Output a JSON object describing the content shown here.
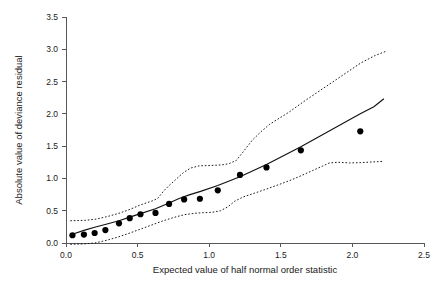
{
  "chart_data": {
    "type": "scatter",
    "title": "",
    "xlabel": "Expected value of half normal order statistic",
    "ylabel": "Absolute value of deviance residual",
    "xlim": [
      0.0,
      2.5
    ],
    "ylim": [
      0.0,
      3.5
    ],
    "xticks": [
      0.0,
      0.5,
      1.0,
      1.5,
      2.0,
      2.5
    ],
    "xticklabels": [
      "0.0",
      "0.5",
      "1.0",
      "1.5",
      "2.0",
      "2.5"
    ],
    "yticks": [
      0.0,
      0.5,
      1.0,
      1.5,
      2.0,
      2.5,
      3.0,
      3.5
    ],
    "yticklabels": [
      "0.0",
      "0.5",
      "1.0",
      "1.5",
      "2.0",
      "2.5",
      "3.0",
      "3.5"
    ],
    "grid": false,
    "legend": "none",
    "series": [
      {
        "name": "Absolute deviance residuals",
        "type": "scatter",
        "marker": "filled-circle",
        "color": "#000000",
        "points": [
          [
            0.045,
            0.12
          ],
          [
            0.125,
            0.13
          ],
          [
            0.2,
            0.155
          ],
          [
            0.275,
            0.2
          ],
          [
            0.37,
            0.305
          ],
          [
            0.445,
            0.385
          ],
          [
            0.52,
            0.445
          ],
          [
            0.625,
            0.465
          ],
          [
            0.72,
            0.605
          ],
          [
            0.825,
            0.675
          ],
          [
            0.935,
            0.685
          ],
          [
            1.06,
            0.815
          ],
          [
            1.215,
            1.055
          ],
          [
            1.4,
            1.17
          ],
          [
            1.64,
            1.435
          ],
          [
            2.055,
            1.73
          ]
        ]
      },
      {
        "name": "Simulated envelope mean",
        "type": "line",
        "style": "solid",
        "color": "#111111",
        "points": [
          [
            0.045,
            0.135
          ],
          [
            0.125,
            0.195
          ],
          [
            0.2,
            0.245
          ],
          [
            0.28,
            0.29
          ],
          [
            0.37,
            0.345
          ],
          [
            0.445,
            0.4
          ],
          [
            0.52,
            0.455
          ],
          [
            0.625,
            0.53
          ],
          [
            0.72,
            0.62
          ],
          [
            0.79,
            0.69
          ],
          [
            0.86,
            0.745
          ],
          [
            0.94,
            0.8
          ],
          [
            1.06,
            0.89
          ],
          [
            1.215,
            1.025
          ],
          [
            1.4,
            1.215
          ],
          [
            1.64,
            1.49
          ],
          [
            1.86,
            1.76
          ],
          [
            2.055,
            2.0
          ],
          [
            2.15,
            2.11
          ],
          [
            2.22,
            2.235
          ]
        ]
      },
      {
        "name": "Simulated envelope upper bound",
        "type": "line",
        "style": "dotted",
        "color": "#111111",
        "points": [
          [
            0.03,
            0.345
          ],
          [
            0.13,
            0.35
          ],
          [
            0.21,
            0.37
          ],
          [
            0.29,
            0.41
          ],
          [
            0.37,
            0.46
          ],
          [
            0.44,
            0.515
          ],
          [
            0.52,
            0.59
          ],
          [
            0.6,
            0.65
          ],
          [
            0.64,
            0.69
          ],
          [
            0.68,
            0.8
          ],
          [
            0.72,
            0.89
          ],
          [
            0.77,
            0.99
          ],
          [
            0.82,
            1.09
          ],
          [
            0.87,
            1.16
          ],
          [
            0.93,
            1.195
          ],
          [
            1.01,
            1.2
          ],
          [
            1.09,
            1.21
          ],
          [
            1.14,
            1.23
          ],
          [
            1.19,
            1.28
          ],
          [
            1.24,
            1.42
          ],
          [
            1.3,
            1.59
          ],
          [
            1.36,
            1.72
          ],
          [
            1.42,
            1.835
          ],
          [
            1.48,
            1.92
          ],
          [
            1.56,
            2.03
          ],
          [
            1.66,
            2.19
          ],
          [
            1.76,
            2.34
          ],
          [
            1.86,
            2.49
          ],
          [
            1.96,
            2.64
          ],
          [
            2.06,
            2.79
          ],
          [
            2.16,
            2.905
          ],
          [
            2.23,
            2.965
          ]
        ]
      },
      {
        "name": "Simulated envelope lower bound",
        "type": "line",
        "style": "dotted",
        "color": "#111111",
        "points": [
          [
            0.03,
            -0.02
          ],
          [
            0.12,
            -0.015
          ],
          [
            0.2,
            0.0
          ],
          [
            0.28,
            0.04
          ],
          [
            0.36,
            0.09
          ],
          [
            0.44,
            0.15
          ],
          [
            0.52,
            0.215
          ],
          [
            0.6,
            0.28
          ],
          [
            0.68,
            0.345
          ],
          [
            0.76,
            0.4
          ],
          [
            0.83,
            0.44
          ],
          [
            0.9,
            0.46
          ],
          [
            0.96,
            0.47
          ],
          [
            1.02,
            0.475
          ],
          [
            1.08,
            0.5
          ],
          [
            1.13,
            0.56
          ],
          [
            1.18,
            0.65
          ],
          [
            1.24,
            0.715
          ],
          [
            1.32,
            0.775
          ],
          [
            1.4,
            0.835
          ],
          [
            1.48,
            0.9
          ],
          [
            1.56,
            0.965
          ],
          [
            1.64,
            1.04
          ],
          [
            1.72,
            1.12
          ],
          [
            1.79,
            1.19
          ],
          [
            1.84,
            1.24
          ],
          [
            1.9,
            1.25
          ],
          [
            1.98,
            1.24
          ],
          [
            2.06,
            1.245
          ],
          [
            2.14,
            1.255
          ],
          [
            2.22,
            1.265
          ]
        ]
      }
    ]
  }
}
